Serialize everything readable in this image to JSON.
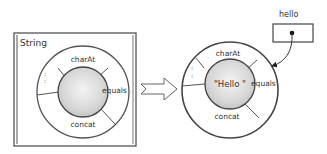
{
  "left_panel": {
    "class_label": "String",
    "methods": {
      "top": "charAt",
      "right": "equals",
      "bottom": "concat",
      "left": ":"
    }
  },
  "arrow": {
    "direction": "right",
    "style": "hollow"
  },
  "right_panel": {
    "value_label": "\"Hello \"",
    "methods": {
      "top": "charAt",
      "right": "equals",
      "bottom": "concat",
      "left": ":"
    }
  },
  "reference": {
    "variable_name": "hello"
  },
  "colors": {
    "stroke": "#444444",
    "inner_fill": "#d8d8d8",
    "ring_fill": "#ffffff"
  }
}
